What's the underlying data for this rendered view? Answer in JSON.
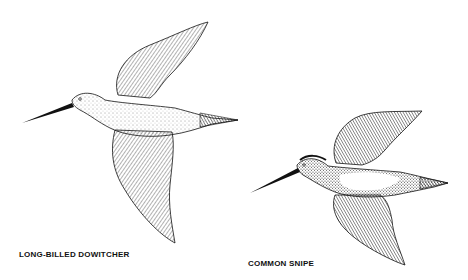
{
  "illustration": {
    "style": "black-and-white pen-and-ink stipple drawing",
    "background": "#ffffff",
    "ink_color": "#111111",
    "birds": [
      {
        "id": "long-billed-dowitcher",
        "label": "LONG-BILLED DOWITCHER",
        "pose": "flying left, wings raised/lowered, long bill"
      },
      {
        "id": "common-snipe",
        "label": "COMMON SNIPE",
        "pose": "flying left, smaller, darker striped plumage"
      }
    ]
  }
}
